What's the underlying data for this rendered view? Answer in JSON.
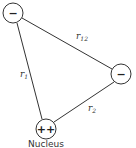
{
  "diagram": {
    "nodes": [
      {
        "id": "electron1",
        "label": "−",
        "x": 13,
        "y": 13
      },
      {
        "id": "electron2",
        "label": "−",
        "x": 121,
        "y": 74
      },
      {
        "id": "nucleus",
        "label": "++",
        "x": 46,
        "y": 129,
        "caption": "Nucleus"
      }
    ],
    "edges": [
      {
        "from": "electron1",
        "to": "electron2",
        "label": "r12"
      },
      {
        "from": "electron1",
        "to": "nucleus",
        "label": "r1"
      },
      {
        "from": "electron2",
        "to": "nucleus",
        "label": "r2"
      }
    ],
    "colors": {
      "stroke": "#333333",
      "background": "#ffffff"
    }
  }
}
